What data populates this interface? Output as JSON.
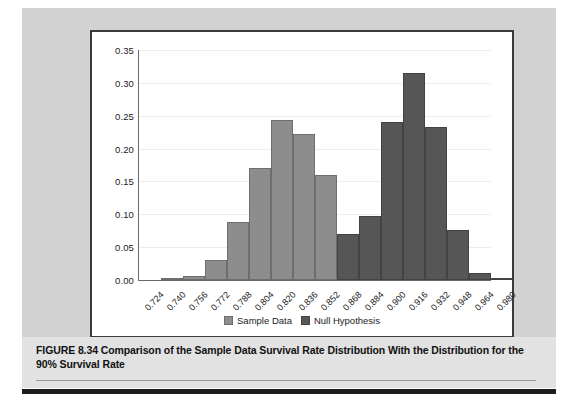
{
  "figure": {
    "caption": "FIGURE 8.34  Comparison of the Sample Data Survival Rate Distribution With the Distribution for the 90% Survival Rate"
  },
  "colors": {
    "sample_data": "#8d8d8d",
    "null_hypothesis": "#565656",
    "panel_background": "#d2d2d2",
    "caption_background": "#e2e2e2",
    "chart_background": "#ffffff",
    "frame": "#3a3a3a",
    "axis": "#6a6a6a",
    "gridline": "#ededed"
  },
  "chart_data": {
    "type": "bar",
    "title": "",
    "subtitle": "",
    "xlabel": "",
    "ylabel": "",
    "grid": true,
    "legend_position": "bottom",
    "categories": [
      "0.724",
      "0.740",
      "0.756",
      "0.772",
      "0.788",
      "0.804",
      "0.820",
      "0.836",
      "0.852",
      "0.868",
      "0.884",
      "0.900",
      "0.916",
      "0.932",
      "0.948",
      "0.964",
      "0.980"
    ],
    "yticks": [
      "0.00",
      "0.05",
      "0.10",
      "0.15",
      "0.20",
      "0.25",
      "0.30",
      "0.35"
    ],
    "ylim": [
      0,
      0.35
    ],
    "series": [
      {
        "name": "Sample Data",
        "color": "#8d8d8d",
        "values": [
          0.0,
          0.002,
          0.006,
          0.03,
          0.089,
          0.17,
          0.243,
          0.222,
          0.16,
          0.024,
          0.011,
          0.0,
          0.0,
          0.0,
          0.0,
          0.0,
          0.0
        ]
      },
      {
        "name": "Null Hypothesis",
        "color": "#565656",
        "values": [
          0.0,
          0.0,
          0.0,
          0.0,
          0.0,
          0.0,
          0.0,
          0.0,
          0.0,
          0.07,
          0.097,
          0.24,
          0.315,
          0.233,
          0.076,
          0.01,
          0.001
        ]
      }
    ]
  },
  "legend": {
    "items": [
      {
        "label": "Sample Data"
      },
      {
        "label": "Null Hypothesis"
      }
    ]
  }
}
